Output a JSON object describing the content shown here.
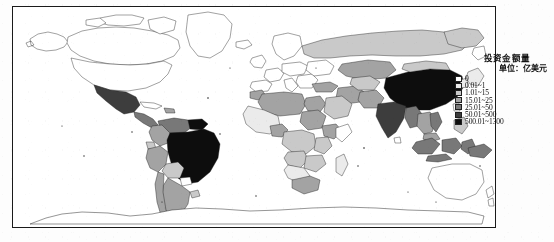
{
  "figure": {
    "kind": "choropleth-world-map",
    "projection": "equirectangular"
  },
  "legend": {
    "title": "投资金额量",
    "unit": "单位：亿美元",
    "entries": [
      {
        "label": "0",
        "color": "#ffffff",
        "min": 0,
        "max": 0
      },
      {
        "label": "0.01~1",
        "color": "#ebebeb",
        "min": 0.01,
        "max": 1
      },
      {
        "label": "1.01~15",
        "color": "#c9c9c9",
        "min": 1.01,
        "max": 15
      },
      {
        "label": "15.01~25",
        "color": "#a3a3a3",
        "min": 15.01,
        "max": 25
      },
      {
        "label": "25.01~50",
        "color": "#787878",
        "min": 25.01,
        "max": 50
      },
      {
        "label": "50.01~500",
        "color": "#3d3d3d",
        "min": 50.01,
        "max": 500
      },
      {
        "label": "500.01~1300",
        "color": "#0d0d0d",
        "min": 500.01,
        "max": 1300
      }
    ]
  },
  "map_data": {
    "type": "choropleth",
    "classes": 7,
    "regions": [
      {
        "name": "China",
        "class": 6
      },
      {
        "name": "Brazil",
        "class": 6
      },
      {
        "name": "India",
        "class": 5
      },
      {
        "name": "Mexico",
        "class": 5
      },
      {
        "name": "Venezuela",
        "class": 5
      },
      {
        "name": "Indonesia",
        "class": 4
      },
      {
        "name": "Argentina",
        "class": 3
      },
      {
        "name": "Chile",
        "class": 3
      },
      {
        "name": "Peru",
        "class": 3
      },
      {
        "name": "Colombia",
        "class": 3
      },
      {
        "name": "Kazakhstan",
        "class": 3
      },
      {
        "name": "Mongolia",
        "class": 2
      },
      {
        "name": "Russia",
        "class": 2
      },
      {
        "name": "Algeria",
        "class": 3
      },
      {
        "name": "Sudan",
        "class": 3
      },
      {
        "name": "Nigeria",
        "class": 3
      },
      {
        "name": "South Africa",
        "class": 3
      },
      {
        "name": "Ethiopia",
        "class": 3
      },
      {
        "name": "Congo DR",
        "class": 2
      },
      {
        "name": "Angola",
        "class": 2
      },
      {
        "name": "Zambia",
        "class": 2
      },
      {
        "name": "Iran",
        "class": 3
      },
      {
        "name": "Saudi Arabia",
        "class": 2
      },
      {
        "name": "Pakistan",
        "class": 3
      },
      {
        "name": "Myanmar",
        "class": 4
      },
      {
        "name": "Thailand",
        "class": 3
      },
      {
        "name": "Vietnam",
        "class": 4
      },
      {
        "name": "Malaysia",
        "class": 3
      },
      {
        "name": "Philippines",
        "class": 2
      },
      {
        "name": "Japan",
        "class": 1
      },
      {
        "name": "South Korea",
        "class": 1
      },
      {
        "name": "Papua New Guinea",
        "class": 4
      },
      {
        "name": "United States",
        "class": 0
      },
      {
        "name": "Canada",
        "class": 0
      },
      {
        "name": "Australia",
        "class": 0
      },
      {
        "name": "New Zealand",
        "class": 0
      },
      {
        "name": "Greenland",
        "class": 0
      },
      {
        "name": "Antarctica",
        "class": 0
      }
    ]
  }
}
